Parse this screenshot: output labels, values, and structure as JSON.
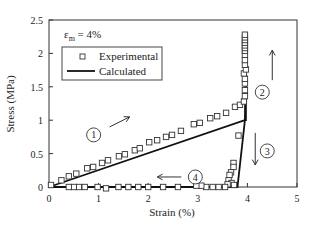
{
  "chart_data": {
    "type": "line",
    "title": "",
    "annotation": "εm = 4%",
    "annotation_main": "ε",
    "annotation_sub": "m",
    "annotation_rest": " = 4%",
    "xlabel": "Strain (%)",
    "ylabel": "Stress (MPa)",
    "xlim": [
      0,
      5
    ],
    "ylim": [
      0,
      2.5
    ],
    "xticks": [
      0,
      1,
      2,
      3,
      4,
      5
    ],
    "yticks": [
      0,
      0.5,
      1,
      1.5,
      2,
      2.5
    ],
    "xtick_labels": [
      "0",
      "1",
      "2",
      "3",
      "4",
      "5"
    ],
    "ytick_labels": [
      "0",
      "0.5",
      "1",
      "1.5",
      "2",
      "2.5"
    ],
    "grid": false,
    "legend_position": "upper left",
    "series": [
      {
        "name": "Experimental",
        "marker": "open-square",
        "points": [
          [
            0.04,
            0.03
          ],
          [
            0.25,
            0.1
          ],
          [
            0.4,
            0.16
          ],
          [
            0.55,
            0.2
          ],
          [
            0.77,
            0.28
          ],
          [
            0.89,
            0.3
          ],
          [
            1.07,
            0.36
          ],
          [
            1.19,
            0.4
          ],
          [
            1.41,
            0.46
          ],
          [
            1.53,
            0.49
          ],
          [
            1.73,
            0.55
          ],
          [
            1.83,
            0.58
          ],
          [
            2.02,
            0.67
          ],
          [
            2.18,
            0.7
          ],
          [
            2.36,
            0.75
          ],
          [
            2.48,
            0.78
          ],
          [
            2.66,
            0.84
          ],
          [
            2.92,
            0.94
          ],
          [
            3.04,
            0.96
          ],
          [
            3.25,
            1.03
          ],
          [
            3.39,
            1.06
          ],
          [
            3.57,
            1.11
          ],
          [
            3.75,
            1.2
          ],
          [
            3.85,
            1.23
          ],
          [
            3.93,
            1.28
          ],
          [
            3.95,
            1.36
          ],
          [
            3.95,
            1.45
          ],
          [
            3.95,
            1.55
          ],
          [
            3.95,
            1.62
          ],
          [
            3.93,
            1.7
          ],
          [
            3.97,
            1.76
          ],
          [
            3.95,
            1.83
          ],
          [
            3.95,
            1.9
          ],
          [
            3.95,
            1.98
          ],
          [
            3.95,
            2.04
          ],
          [
            3.95,
            2.08
          ],
          [
            3.95,
            2.12
          ],
          [
            3.95,
            2.16
          ],
          [
            3.95,
            2.2
          ],
          [
            3.95,
            2.24
          ],
          [
            3.95,
            2.28
          ],
          [
            3.82,
            0.77
          ],
          [
            3.72,
            0.36
          ],
          [
            3.72,
            0.3
          ],
          [
            3.67,
            0.22
          ],
          [
            3.64,
            0.18
          ],
          [
            3.62,
            0.1
          ],
          [
            3.68,
            0.06
          ],
          [
            3.73,
            0.03
          ],
          [
            3.6,
            0.04
          ],
          [
            3.55,
            0.0
          ],
          [
            3.42,
            0.0
          ],
          [
            3.3,
            0.0
          ],
          [
            3.17,
            0.0
          ],
          [
            3.07,
            0.02
          ],
          [
            2.97,
            0.02
          ],
          [
            2.6,
            0.0
          ],
          [
            2.3,
            0.0
          ],
          [
            2.0,
            0.0
          ],
          [
            1.8,
            0.0
          ],
          [
            1.6,
            0.0
          ],
          [
            1.4,
            0.0
          ],
          [
            1.15,
            -0.02
          ],
          [
            0.98,
            0.0
          ],
          [
            0.72,
            0.0
          ],
          [
            0.6,
            0.0
          ],
          [
            0.5,
            0.0
          ],
          [
            0.4,
            0.0
          ]
        ]
      },
      {
        "name": "Calculated",
        "style": "solid",
        "points": [
          [
            0,
            0
          ],
          [
            3.95,
            1.0
          ],
          [
            3.97,
            2.22
          ],
          [
            3.97,
            1.0
          ],
          [
            3.95,
            1.0
          ],
          [
            3.8,
            0.0
          ],
          [
            0,
            0
          ]
        ]
      }
    ],
    "stage_labels": [
      {
        "label": "1",
        "x": 0.9,
        "y": 0.78,
        "arrow": "up-right"
      },
      {
        "label": "2",
        "x": 4.3,
        "y": 1.42,
        "arrow": "up"
      },
      {
        "label": "3",
        "x": 4.4,
        "y": 0.54,
        "arrow": "down"
      },
      {
        "label": "4",
        "x": 2.95,
        "y": 0.15,
        "arrow": "left"
      }
    ]
  }
}
